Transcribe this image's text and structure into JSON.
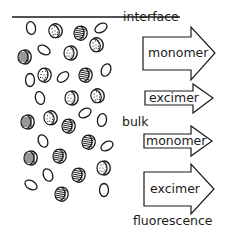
{
  "diagram": {
    "labels": {
      "interface": "interface",
      "bulk": "bulk",
      "fluorescence": "fluorescence"
    },
    "arrows": [
      {
        "label": "monomer",
        "region": "interface"
      },
      {
        "label": "excimer",
        "region": "interface"
      },
      {
        "label": "monomer",
        "region": "bulk"
      },
      {
        "label": "excimer",
        "region": "bulk"
      }
    ],
    "molecule_types": {
      "open": "monomer molecule (open ellipse)",
      "striped": "molecule with striped texture",
      "dotted": "molecule with dotted texture"
    },
    "molecules": [
      {
        "type": "open",
        "x": 31,
        "y": 28,
        "rot": -10
      },
      {
        "type": "dotted",
        "x": 55,
        "y": 31,
        "rot": -20
      },
      {
        "type": "striped",
        "x": 80,
        "y": 33,
        "rot": 10
      },
      {
        "type": "open",
        "x": 101,
        "y": 28,
        "rot": -30,
        "flat": true
      },
      {
        "type": "striped",
        "x": 24,
        "y": 57,
        "rot": 0
      },
      {
        "type": "open",
        "x": 44,
        "y": 50,
        "rot": 30,
        "flat": true
      },
      {
        "type": "dotted",
        "x": 70,
        "y": 53,
        "rot": 0
      },
      {
        "type": "dotted",
        "x": 96,
        "y": 45,
        "rot": -20
      },
      {
        "type": "open",
        "x": 30,
        "y": 80,
        "rot": 0
      },
      {
        "type": "dotted",
        "x": 44,
        "y": 75,
        "rot": 10
      },
      {
        "type": "open",
        "x": 63,
        "y": 77,
        "rot": -40,
        "flat": true
      },
      {
        "type": "striped",
        "x": 85,
        "y": 75,
        "rot": 10
      },
      {
        "type": "open",
        "x": 106,
        "y": 70,
        "rot": 25
      },
      {
        "type": "open",
        "x": 40,
        "y": 98,
        "rot": -15
      },
      {
        "type": "dotted",
        "x": 71,
        "y": 98,
        "rot": 0
      },
      {
        "type": "dotted",
        "x": 97,
        "y": 96,
        "rot": -20
      },
      {
        "type": "striped",
        "x": 27,
        "y": 122,
        "rot": 0
      },
      {
        "type": "dotted",
        "x": 50,
        "y": 118,
        "rot": -15
      },
      {
        "type": "striped",
        "x": 68,
        "y": 126,
        "rot": 10
      },
      {
        "type": "open",
        "x": 85,
        "y": 113,
        "rot": -30,
        "flat": true
      },
      {
        "type": "open",
        "x": 102,
        "y": 120,
        "rot": 10
      },
      {
        "type": "open",
        "x": 43,
        "y": 141,
        "rot": -25
      },
      {
        "type": "striped",
        "x": 88,
        "y": 142,
        "rot": 10
      },
      {
        "type": "open",
        "x": 107,
        "y": 146,
        "rot": -30,
        "flat": true
      },
      {
        "type": "striped",
        "x": 30,
        "y": 158,
        "rot": 0
      },
      {
        "type": "striped",
        "x": 59,
        "y": 156,
        "rot": 10
      },
      {
        "type": "dotted",
        "x": 103,
        "y": 168,
        "rot": 0
      },
      {
        "type": "open",
        "x": 48,
        "y": 175,
        "rot": -25
      },
      {
        "type": "striped",
        "x": 78,
        "y": 175,
        "rot": 10
      },
      {
        "type": "open",
        "x": 31,
        "y": 185,
        "rot": 30,
        "flat": true
      },
      {
        "type": "striped",
        "x": 61,
        "y": 194,
        "rot": 10
      },
      {
        "type": "open",
        "x": 104,
        "y": 190,
        "rot": 0
      }
    ],
    "colors": {
      "ink": "#1a1a1a",
      "background": "#ffffff"
    }
  }
}
